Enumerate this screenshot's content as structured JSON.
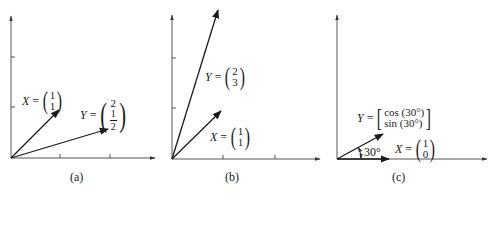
{
  "panels": [
    {
      "id": "a",
      "caption": "(a)",
      "vectors": [
        {
          "name": "X",
          "components": [
            "1",
            "1"
          ]
        },
        {
          "name": "Y",
          "components": [
            "2",
            "1/2"
          ],
          "fraction": {
            "num": "1",
            "den": "2"
          }
        }
      ]
    },
    {
      "id": "b",
      "caption": "(b)",
      "vectors": [
        {
          "name": "Y",
          "components": [
            "2",
            "3"
          ]
        },
        {
          "name": "X",
          "components": [
            "1",
            "1"
          ]
        }
      ]
    },
    {
      "id": "c",
      "caption": "(c)",
      "angle_label": "30°",
      "vectors": [
        {
          "name": "Y",
          "components": [
            "cos (30°)",
            "sin (30°)"
          ]
        },
        {
          "name": "X",
          "components": [
            "1",
            "0"
          ]
        }
      ]
    }
  ],
  "symbols": {
    "equals": "="
  },
  "colors": {
    "ink": "#1a1a1a",
    "background": "#ffffff"
  }
}
